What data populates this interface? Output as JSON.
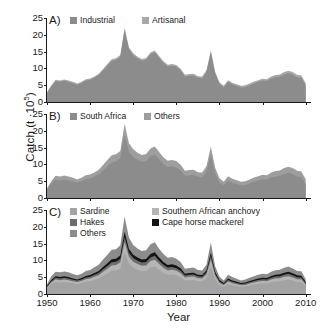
{
  "axes": {
    "ylabel_text": "Catch (t ·10",
    "ylabel_exp": "5",
    "ylabel_tail": ")",
    "xlabel": "Year",
    "yticks": [
      "25",
      "20",
      "15",
      "10",
      "5",
      "0"
    ],
    "xticks": [
      "1950",
      "1960",
      "1970",
      "1980",
      "1990",
      "2000",
      "2010"
    ],
    "ylim": [
      0,
      25
    ],
    "xlim": [
      1950,
      2011
    ]
  },
  "colors": {
    "industrial": "#8c8c8c",
    "artisanal": "#a8a8a8",
    "south_africa": "#8c8c8c",
    "others_b": "#9e9e9e",
    "sardine": "#a3a3a3",
    "anchovy": "#b5b5b5",
    "hakes": "#6e6e6e",
    "mackerel": "#141414",
    "others_c": "#8c8c8c",
    "axis": "#1a1a1a"
  },
  "panels": [
    {
      "tag": "A)",
      "legend": [
        {
          "label": "Industrial",
          "color": "#8c8c8c",
          "x": 23,
          "y": -2
        },
        {
          "label": "Artisanal",
          "color": "#a8a8a8",
          "x": 95,
          "y": -2
        }
      ]
    },
    {
      "tag": "B)",
      "legend": [
        {
          "label": "South Africa",
          "color": "#8c8c8c",
          "x": 23,
          "y": -2
        },
        {
          "label": "Others",
          "color": "#9e9e9e",
          "x": 97,
          "y": -2
        }
      ]
    },
    {
      "tag": "C)",
      "legend": [
        {
          "label": "Sardine",
          "color": "#a3a3a3",
          "x": 23,
          "y": -3
        },
        {
          "label": "Southern African anchovy",
          "color": "#b5b5b5",
          "x": 105,
          "y": -3
        },
        {
          "label": "Hakes",
          "color": "#6e6e6e",
          "x": 23,
          "y": 8
        },
        {
          "label": "Cape horse mackerel",
          "color": "#141414",
          "x": 105,
          "y": 8
        },
        {
          "label": "Others",
          "color": "#8c8c8c",
          "x": 23,
          "y": 19
        }
      ]
    }
  ],
  "chart_data": {
    "type": "area",
    "title": "",
    "xlabel": "Year",
    "ylabel": "Catch (t ·10^5)",
    "ylim": [
      0,
      25
    ],
    "xlim": [
      1950,
      2011
    ],
    "grid": false,
    "legend_position": "top-inside",
    "x": [
      1950,
      1951,
      1952,
      1953,
      1954,
      1955,
      1956,
      1957,
      1958,
      1959,
      1960,
      1961,
      1962,
      1963,
      1964,
      1965,
      1966,
      1967,
      1968,
      1969,
      1970,
      1971,
      1972,
      1973,
      1974,
      1975,
      1976,
      1977,
      1978,
      1979,
      1980,
      1981,
      1982,
      1983,
      1984,
      1985,
      1986,
      1987,
      1988,
      1989,
      1990,
      1991,
      1992,
      1993,
      1994,
      1995,
      1996,
      1997,
      1998,
      1999,
      2000,
      2001,
      2002,
      2003,
      2004,
      2005,
      2006,
      2007,
      2008,
      2009,
      2010
    ],
    "panels": [
      {
        "tag": "A)",
        "stacked": true,
        "series": [
          {
            "name": "Industrial",
            "color": "#8c8c8c",
            "values": [
              2.6,
              4.6,
              6.2,
              6.0,
              6.3,
              6.0,
              5.6,
              5.1,
              5.6,
              6.4,
              6.6,
              7.2,
              8.0,
              9.4,
              10.8,
              12.2,
              12.5,
              13.5,
              21.5,
              15.8,
              14.0,
              13.0,
              12.3,
              12.6,
              14.2,
              14.8,
              13.2,
              11.6,
              10.6,
              10.8,
              10.5,
              9.4,
              7.6,
              7.8,
              7.9,
              7.2,
              7.1,
              9.0,
              14.8,
              8.5,
              5.4,
              4.3,
              6.0,
              5.2,
              4.8,
              4.3,
              4.5,
              5.0,
              5.6,
              6.0,
              6.4,
              6.3,
              7.0,
              7.4,
              7.6,
              8.2,
              8.6,
              8.2,
              7.4,
              7.2,
              4.9
            ]
          },
          {
            "name": "Artisanal",
            "color": "#a8a8a8",
            "values": [
              0.3,
              0.4,
              0.4,
              0.4,
              0.4,
              0.4,
              0.4,
              0.4,
              0.4,
              0.4,
              0.4,
              0.4,
              0.4,
              0.4,
              0.5,
              0.5,
              0.5,
              0.5,
              0.6,
              0.5,
              0.5,
              0.5,
              0.5,
              0.5,
              0.5,
              0.5,
              0.5,
              0.5,
              0.5,
              0.5,
              0.5,
              0.5,
              0.5,
              0.5,
              0.5,
              0.5,
              0.5,
              0.5,
              0.5,
              0.5,
              0.5,
              0.5,
              0.5,
              0.5,
              0.5,
              0.5,
              0.5,
              0.5,
              0.5,
              0.5,
              0.5,
              0.5,
              0.6,
              0.6,
              0.6,
              0.7,
              0.7,
              0.7,
              0.7,
              0.7,
              0.7
            ]
          }
        ]
      },
      {
        "tag": "B)",
        "stacked": true,
        "series": [
          {
            "name": "South Africa",
            "color": "#8c8c8c",
            "values": [
              2.4,
              4.2,
              5.4,
              5.2,
              5.4,
              5.2,
              4.9,
              4.6,
              5.0,
              5.6,
              5.8,
              6.4,
              7.0,
              8.2,
              9.4,
              10.6,
              10.9,
              11.8,
              18.8,
              13.8,
              12.2,
              11.4,
              10.8,
              11.0,
              12.4,
              12.9,
              11.5,
              10.1,
              9.2,
              9.4,
              9.1,
              8.2,
              6.6,
              6.8,
              6.9,
              6.3,
              6.2,
              7.8,
              12.9,
              7.4,
              4.7,
              3.7,
              5.2,
              4.5,
              4.2,
              3.7,
              3.9,
              4.3,
              4.9,
              5.2,
              5.6,
              5.5,
              6.1,
              6.4,
              6.6,
              7.1,
              7.5,
              7.1,
              6.4,
              6.2,
              4.2
            ]
          },
          {
            "name": "Others",
            "color": "#9e9e9e",
            "values": [
              0.5,
              0.8,
              1.2,
              1.2,
              1.3,
              1.2,
              1.1,
              0.9,
              1.0,
              1.2,
              1.2,
              1.2,
              1.4,
              1.6,
              1.9,
              2.1,
              2.1,
              2.2,
              3.3,
              2.5,
              2.3,
              2.1,
              2.0,
              2.1,
              2.3,
              2.4,
              2.2,
              2.0,
              1.9,
              1.9,
              1.9,
              1.7,
              1.5,
              1.5,
              1.5,
              1.4,
              1.4,
              1.7,
              2.4,
              1.6,
              1.2,
              1.1,
              1.3,
              1.2,
              1.1,
              1.1,
              1.1,
              1.2,
              1.2,
              1.3,
              1.3,
              1.3,
              1.5,
              1.6,
              1.6,
              1.8,
              1.8,
              1.8,
              1.7,
              1.7,
              1.4
            ]
          }
        ]
      },
      {
        "tag": "C)",
        "stacked": true,
        "series": [
          {
            "name": "Sardine",
            "color": "#a3a3a3",
            "values": [
              1.6,
              2.9,
              3.6,
              3.4,
              3.6,
              3.4,
              3.2,
              3.0,
              3.3,
              3.7,
              3.8,
              4.2,
              4.6,
              5.4,
              6.1,
              6.9,
              7.0,
              7.6,
              12.4,
              9.0,
              7.8,
              7.2,
              6.8,
              6.9,
              7.9,
              8.2,
              7.2,
              6.3,
              5.7,
              5.8,
              5.6,
              5.0,
              4.0,
              4.1,
              4.2,
              3.8,
              3.7,
              4.7,
              8.2,
              4.4,
              2.7,
              2.1,
              3.0,
              2.6,
              2.4,
              2.1,
              2.2,
              2.5,
              2.8,
              3.0,
              3.2,
              3.1,
              3.5,
              3.7,
              3.8,
              4.1,
              4.3,
              4.0,
              3.6,
              3.5,
              2.3
            ]
          },
          {
            "name": "Southern African anchovy",
            "color": "#b5b5b5",
            "values": [
              0.3,
              0.5,
              0.7,
              0.7,
              0.7,
              0.7,
              0.6,
              0.6,
              0.6,
              0.7,
              0.8,
              0.9,
              1.0,
              1.2,
              1.4,
              1.6,
              1.6,
              1.8,
              3.0,
              2.1,
              1.8,
              1.7,
              1.6,
              1.6,
              1.9,
              2.0,
              1.7,
              1.5,
              1.3,
              1.4,
              1.3,
              1.2,
              0.9,
              1.0,
              1.0,
              0.9,
              0.9,
              1.1,
              2.0,
              1.0,
              0.6,
              0.5,
              0.7,
              0.6,
              0.5,
              0.5,
              0.5,
              0.6,
              0.6,
              0.7,
              0.7,
              0.7,
              0.8,
              0.9,
              0.9,
              1.0,
              1.0,
              0.9,
              0.8,
              0.8,
              0.5
            ]
          },
          {
            "name": "Hakes",
            "color": "#6e6e6e",
            "values": [
              0.25,
              0.4,
              0.5,
              0.5,
              0.5,
              0.5,
              0.45,
              0.4,
              0.45,
              0.5,
              0.55,
              0.6,
              0.65,
              0.75,
              0.85,
              0.95,
              1.0,
              1.05,
              1.6,
              1.2,
              1.1,
              1.0,
              0.95,
              1.0,
              1.1,
              1.15,
              1.0,
              0.9,
              0.85,
              0.85,
              0.8,
              0.75,
              0.6,
              0.6,
              0.6,
              0.55,
              0.55,
              0.65,
              1.1,
              0.65,
              0.45,
              0.35,
              0.5,
              0.45,
              0.4,
              0.35,
              0.4,
              0.4,
              0.45,
              0.5,
              0.5,
              0.5,
              0.55,
              0.6,
              0.6,
              0.65,
              0.7,
              0.65,
              0.6,
              0.6,
              0.4
            ]
          },
          {
            "name": "Cape horse mackerel",
            "color": "#141414",
            "values": [
              0.2,
              0.35,
              0.45,
              0.45,
              0.45,
              0.45,
              0.4,
              0.35,
              0.4,
              0.45,
              0.5,
              0.55,
              0.6,
              0.7,
              0.8,
              0.9,
              0.9,
              1.0,
              1.5,
              1.1,
              1.0,
              0.95,
              0.9,
              0.9,
              1.0,
              1.05,
              0.95,
              0.85,
              0.8,
              0.8,
              0.75,
              0.7,
              0.55,
              0.55,
              0.55,
              0.5,
              0.5,
              0.6,
              1.0,
              0.6,
              0.4,
              0.3,
              0.45,
              0.4,
              0.35,
              0.3,
              0.35,
              0.4,
              0.4,
              0.45,
              0.45,
              0.45,
              0.5,
              0.55,
              0.55,
              0.6,
              0.6,
              0.6,
              0.55,
              0.55,
              0.35
            ]
          },
          {
            "name": "Others",
            "color": "#8c8c8c",
            "values": [
              0.55,
              1.1,
              1.4,
              1.4,
              1.45,
              1.4,
              1.3,
              1.2,
              1.3,
              1.5,
              1.5,
              1.7,
              1.85,
              2.2,
              2.5,
              2.8,
              2.8,
              3.05,
              4.6,
              3.4,
              2.9,
              2.7,
              2.55,
              2.6,
              2.9,
              3.0,
              2.65,
              2.35,
              2.15,
              2.15,
              2.05,
              1.85,
              1.5,
              1.5,
              1.55,
              1.4,
              1.35,
              1.7,
              3.0,
              1.6,
              1.0,
              0.8,
              1.1,
              1.0,
              0.9,
              0.8,
              0.85,
              0.95,
              1.05,
              1.1,
              1.15,
              1.15,
              1.25,
              1.35,
              1.35,
              1.45,
              1.55,
              1.45,
              1.3,
              1.3,
              0.85
            ]
          }
        ]
      }
    ]
  }
}
